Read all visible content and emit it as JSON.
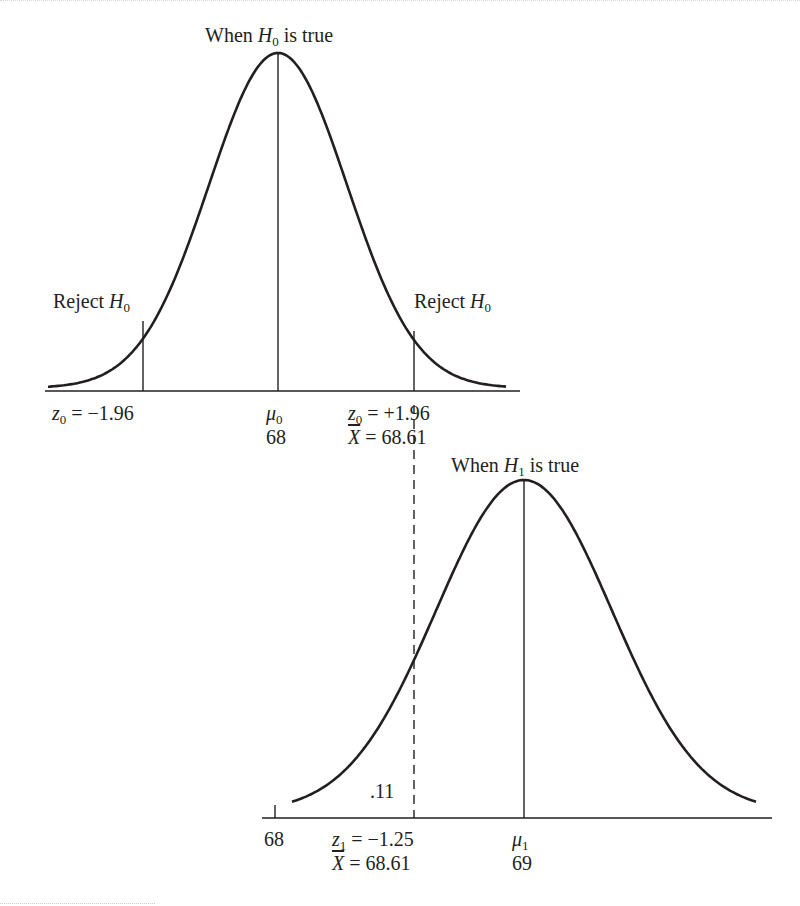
{
  "chart_data": [
    {
      "type": "area",
      "name": "null-distribution",
      "title": "When H0 is true",
      "curve": "normal",
      "mean_label": "μ0",
      "mean_value": "68",
      "critical_left": {
        "label": "z0 = −1.96",
        "region": "Reject H0"
      },
      "critical_right": {
        "label": "z0 = +1.96",
        "xbar": "X̄ = 68.61",
        "region": "Reject H0"
      },
      "x_ticks": [
        {
          "z": -1.96,
          "label": "z0 = −1.96"
        },
        {
          "z": 0,
          "label": "μ0 68"
        },
        {
          "z": 1.96,
          "label": "z0 = +1.96 / X̄ = 68.61"
        }
      ]
    },
    {
      "type": "area",
      "name": "alternative-distribution",
      "title": "When H1 is true",
      "curve": "normal",
      "mean_label": "μ1",
      "mean_value": "69",
      "cutoff": {
        "z": -1.25,
        "label": "z1 = −1.25",
        "xbar": "X̄ = 68.61",
        "area_left": ".11",
        "line": "dashed"
      },
      "x_ticks": [
        {
          "value": 68,
          "label": "68"
        },
        {
          "z": -1.25,
          "label": "z1 = −1.25 / X̄ = 68.61"
        },
        {
          "z": 0,
          "label": "μ1 69"
        }
      ]
    }
  ],
  "top": {
    "title": {
      "pre": "When ",
      "var": "H",
      "sub": "0",
      "post": " is true"
    },
    "reject_left": {
      "pre": "Reject ",
      "var": "H",
      "sub": "0"
    },
    "reject_right": {
      "pre": "Reject ",
      "var": "H",
      "sub": "0"
    },
    "z_left": {
      "var": "z",
      "sub": "0",
      "rest": " = −1.96"
    },
    "mu": {
      "var": "μ",
      "sub": "0"
    },
    "mu_value": "68",
    "z_right": {
      "var": "z",
      "sub": "0",
      "rest": " = +1.96"
    },
    "xbar": {
      "var": "X",
      "rest": " = 68.61"
    }
  },
  "bottom": {
    "title": {
      "pre": "When ",
      "var": "H",
      "sub": "1",
      "post": " is true"
    },
    "area_label": ".11",
    "tick_68": "68",
    "z": {
      "var": "z",
      "sub": "1",
      "rest": " = −1.25"
    },
    "xbar": {
      "var": "X",
      "rest": " = 68.61"
    },
    "mu": {
      "var": "μ",
      "sub": "1"
    },
    "mu_value": "69"
  }
}
